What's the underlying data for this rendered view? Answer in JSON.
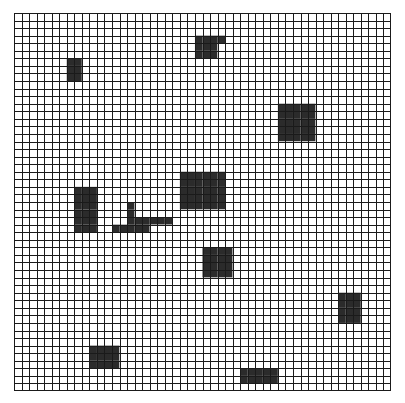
{
  "grid": {
    "cols": 50,
    "rows": 50,
    "line_color": "#1a1a1a",
    "empty_color": "#ffffff",
    "filled_color": "#2b2b2b"
  },
  "obstacles": [
    {
      "name": "obstacle-1",
      "cells": [
        [
          7,
          6
        ],
        [
          8,
          6
        ],
        [
          7,
          7
        ],
        [
          8,
          7
        ],
        [
          7,
          8
        ],
        [
          8,
          8
        ]
      ]
    },
    {
      "name": "obstacle-2",
      "rect_rows": [
        {
          "row": 3,
          "col_start": 24,
          "col_end": 27
        },
        {
          "row": 4,
          "col_start": 24,
          "col_end": 26
        },
        {
          "row": 5,
          "col_start": 24,
          "col_end": 26
        }
      ]
    },
    {
      "name": "obstacle-3",
      "rect": {
        "col": 35,
        "row": 12,
        "w": 5,
        "h": 5
      }
    },
    {
      "name": "obstacle-4",
      "rect": {
        "col": 22,
        "row": 21,
        "w": 6,
        "h": 5
      }
    },
    {
      "name": "obstacle-5",
      "rect": {
        "col": 8,
        "row": 23,
        "w": 3,
        "h": 6
      }
    },
    {
      "name": "obstacle-6",
      "rect_rows": [
        {
          "row": 25,
          "col_start": 15,
          "col_end": 15
        },
        {
          "row": 26,
          "col_start": 15,
          "col_end": 15
        },
        {
          "row": 27,
          "col_start": 15,
          "col_end": 20
        },
        {
          "row": 28,
          "col_start": 13,
          "col_end": 17
        }
      ]
    },
    {
      "name": "obstacle-7",
      "rect": {
        "col": 25,
        "row": 31,
        "w": 4,
        "h": 4
      }
    },
    {
      "name": "obstacle-8",
      "rect": {
        "col": 43,
        "row": 37,
        "w": 3,
        "h": 4
      }
    },
    {
      "name": "obstacle-9",
      "rect": {
        "col": 10,
        "row": 44,
        "w": 4,
        "h": 3
      }
    },
    {
      "name": "obstacle-10",
      "rect": {
        "col": 30,
        "row": 47,
        "w": 5,
        "h": 2
      }
    }
  ]
}
